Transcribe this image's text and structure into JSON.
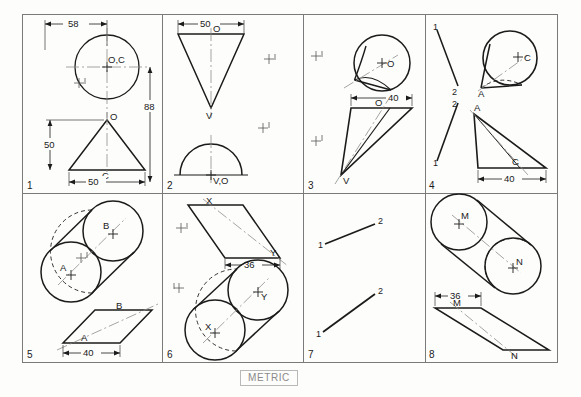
{
  "sheet": {
    "title": "METRIC",
    "units_label": "METRIC",
    "line_color": "#1b1b1b",
    "border_color": "#7a7a7a",
    "center_line_color": "#8d8d8d",
    "background": "#fdfdfb",
    "grid": {
      "columns": 4,
      "rows": 2,
      "panel_count": 8
    }
  },
  "panels": [
    {
      "number": "1",
      "labels": [
        "O,C",
        "O",
        "C"
      ],
      "dimensions": [
        "58",
        "88",
        "50",
        "50"
      ],
      "top_view": {
        "shape": "circle",
        "center_label": "O,C"
      },
      "front_view": {
        "shape": "triangle",
        "apex_label": "O",
        "base_label": "C"
      }
    },
    {
      "number": "2",
      "labels": [
        "O",
        "V",
        "V,O"
      ],
      "dimensions": [
        "50"
      ],
      "top_view": {
        "shape": "inverted-triangle",
        "top_label": "O",
        "apex_label": "V"
      },
      "front_view": {
        "shape": "semicircle",
        "center_label": "V,O"
      }
    },
    {
      "number": "3",
      "labels": [
        "O",
        "O",
        "V"
      ],
      "dimensions": [
        "40"
      ],
      "top_view": {
        "shape": "tilted-cone-circle",
        "center_label": "O"
      },
      "front_view": {
        "shape": "oblique-triangle",
        "top_label": "O",
        "apex_label": "V"
      }
    },
    {
      "number": "4",
      "labels": [
        "C",
        "A",
        "A",
        "C",
        "1",
        "2",
        "2",
        "1"
      ],
      "dimensions": [
        "40"
      ],
      "top_view": {
        "shape": "tilted-cone-circle",
        "center_label": "C",
        "apex_label": "A"
      },
      "front_view": {
        "shape": "oblique-triangle",
        "apex_label": "A",
        "point_label": "C"
      }
    },
    {
      "number": "5",
      "labels": [
        "B",
        "A",
        "B",
        "A"
      ],
      "dimensions": [
        "40"
      ],
      "top_view": {
        "shape": "tilted-cylinder",
        "near_center": "A",
        "far_center": "B"
      },
      "front_view": {
        "shape": "parallelogram",
        "near_label": "A",
        "far_label": "B"
      }
    },
    {
      "number": "6",
      "labels": [
        "X",
        "Y",
        "Y",
        "X"
      ],
      "dimensions": [
        "36"
      ],
      "top_view": {
        "shape": "parallelogram",
        "near_label": "X",
        "far_label": "Y"
      },
      "front_view": {
        "shape": "tilted-cylinder",
        "near_center": "X",
        "far_center": "Y"
      }
    },
    {
      "number": "7",
      "labels": [
        "1",
        "2",
        "1",
        "2"
      ],
      "dimensions": [],
      "top_view": {
        "shape": "line",
        "start_label": "1",
        "end_label": "2"
      },
      "front_view": {
        "shape": "line",
        "start_label": "1",
        "end_label": "2"
      }
    },
    {
      "number": "8",
      "labels": [
        "M",
        "N",
        "M",
        "N"
      ],
      "dimensions": [
        "36"
      ],
      "top_view": {
        "shape": "tilted-cylinder",
        "near_center": "M",
        "far_center": "N"
      },
      "front_view": {
        "shape": "parallelogram",
        "near_label": "M",
        "far_label": "N"
      }
    }
  ]
}
